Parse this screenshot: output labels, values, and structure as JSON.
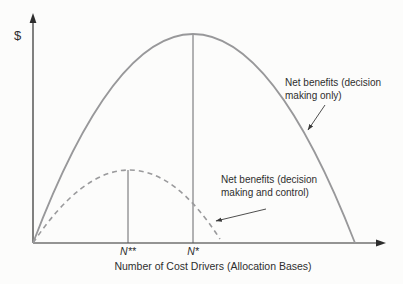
{
  "chart_data": {
    "type": "line",
    "title": "",
    "xlabel": "Number of Cost Drivers (Allocation Bases)",
    "ylabel": "$",
    "x_tick_labels": [
      "N**",
      "N*"
    ],
    "axes": {
      "grid": false,
      "numeric_scales": false,
      "origin_px": [
        33,
        243
      ],
      "x_axis_end_px": [
        386,
        243
      ],
      "y_axis_end_px": [
        33,
        13
      ]
    },
    "series": [
      {
        "name": "Net benefits (decision making only)",
        "line_style": "solid",
        "color": "#98989a",
        "peak_tick": "N*",
        "geometry_px": {
          "start": [
            33,
            243
          ],
          "peak": [
            193,
            34
          ],
          "end": [
            355,
            243
          ]
        }
      },
      {
        "name": "Net benefits (decision making and control)",
        "line_style": "dashed",
        "color": "#9a9a9c",
        "peak_tick": "N**",
        "geometry_px": {
          "start": [
            33,
            243
          ],
          "peak": [
            128,
            170
          ],
          "end": [
            220,
            239
          ]
        }
      }
    ],
    "drop_lines": [
      {
        "tick": "N*",
        "x": 193,
        "y_top": 34,
        "y_bottom": 243
      },
      {
        "tick": "N**",
        "x": 128,
        "y_top": 170,
        "y_bottom": 243
      }
    ],
    "annotation_arrows": [
      {
        "for_series": 0,
        "from": [
          325,
          105
        ],
        "to": [
          308,
          130
        ]
      },
      {
        "for_series": 1,
        "from": [
          266,
          209
        ],
        "to": [
          216,
          221
        ]
      }
    ],
    "colors": {
      "axis": "#2d2d2d",
      "text": "#2e2e2e",
      "drop_line": "#58585a",
      "annotation_arrow": "#3a3a3a"
    }
  }
}
